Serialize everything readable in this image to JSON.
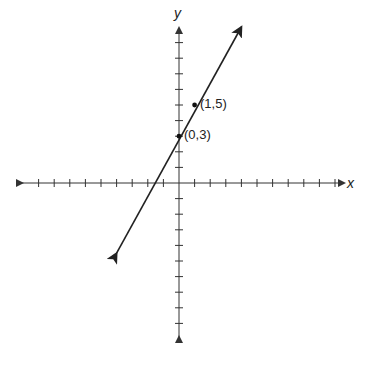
{
  "chart_data": {
    "type": "line",
    "title": "",
    "xlabel": "x",
    "ylabel": "y",
    "xlim": [
      -10,
      10
    ],
    "ylim": [
      -10,
      10
    ],
    "grid": false,
    "tick_labels": false,
    "tick_step": 1,
    "series": [
      {
        "name": "line",
        "equation": "y = 2x + 3",
        "slope": 2,
        "intercept": 3,
        "x": [
          -4,
          4
        ],
        "y": [
          -4.5,
          10
        ],
        "arrows_both_ends": true
      }
    ],
    "points": [
      {
        "x": 0,
        "y": 3,
        "label": "(0,3)"
      },
      {
        "x": 1,
        "y": 5,
        "label": "(1,5)"
      }
    ]
  },
  "labels": {
    "x_axis": "x",
    "y_axis": "y",
    "point_a": "(0,3)",
    "point_b": "(1,5)"
  },
  "colors": {
    "axis": "#333333",
    "line": "#222222"
  }
}
